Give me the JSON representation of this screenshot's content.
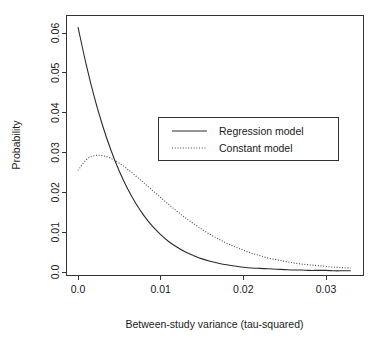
{
  "chart_data": {
    "type": "line",
    "title": "",
    "subtitle": "",
    "xlabel": "Between-study variance (tau-squared)",
    "ylabel": "Probability",
    "xlim": [
      -0.0005,
      0.0345
    ],
    "ylim": [
      0.0,
      0.0655
    ],
    "grid": false,
    "legend_position": "upper-center-right",
    "xticks": [
      0.0,
      0.01,
      0.02,
      0.03
    ],
    "xtick_labels": [
      "0.0",
      "0.01",
      "0.02",
      "0.03"
    ],
    "yticks": [
      0.0,
      0.01,
      0.02,
      0.03,
      0.04,
      0.05,
      0.06
    ],
    "ytick_labels": [
      "0.0",
      "0.01",
      "0.02",
      "0.03",
      "0.04",
      "0.05",
      "0.06"
    ],
    "x": [
      0.0,
      0.001,
      0.002,
      0.003,
      0.004,
      0.005,
      0.006,
      0.007,
      0.008,
      0.009,
      0.01,
      0.011,
      0.012,
      0.013,
      0.014,
      0.015,
      0.016,
      0.017,
      0.018,
      0.019,
      0.02,
      0.021,
      0.022,
      0.023,
      0.024,
      0.025,
      0.026,
      0.027,
      0.028,
      0.029,
      0.03,
      0.031,
      0.032,
      0.033
    ],
    "series": [
      {
        "name": "Regression model",
        "style": "solid",
        "color": "#2b2b2b",
        "values": [
          0.0615,
          0.052,
          0.0437,
          0.0366,
          0.0305,
          0.0253,
          0.0209,
          0.0172,
          0.0141,
          0.0115,
          0.0094,
          0.0076,
          0.0062,
          0.005,
          0.0041,
          0.0033,
          0.0027,
          0.0022,
          0.0018,
          0.0015,
          0.0012,
          0.001,
          0.0009,
          0.0008,
          0.0007,
          0.0006,
          0.0005,
          0.0005,
          0.0004,
          0.0004,
          0.0004,
          0.0003,
          0.0003,
          0.0003
        ]
      },
      {
        "name": "Constant model",
        "style": "dotted",
        "color": "#4a4a4a",
        "values": [
          0.0255,
          0.0282,
          0.0292,
          0.0292,
          0.0285,
          0.0273,
          0.0258,
          0.0241,
          0.0223,
          0.0205,
          0.0187,
          0.0169,
          0.0152,
          0.0136,
          0.0121,
          0.0107,
          0.0094,
          0.0083,
          0.0072,
          0.0063,
          0.0055,
          0.0047,
          0.0041,
          0.0035,
          0.0031,
          0.0027,
          0.0023,
          0.002,
          0.0018,
          0.0016,
          0.0014,
          0.0012,
          0.0011,
          0.001
        ]
      }
    ],
    "legend_entries": [
      {
        "label": "Regression model",
        "style": "solid"
      },
      {
        "label": "Constant model",
        "style": "dotted"
      }
    ]
  },
  "axes": {
    "x_title": "Between-study variance (tau-squared)",
    "y_title": "Probability"
  },
  "colors": {
    "background": "#ffffff",
    "axis": "#333333",
    "text": "#1a1a1a",
    "series_regression": "#2b2b2b",
    "series_constant": "#4a4a4a"
  }
}
